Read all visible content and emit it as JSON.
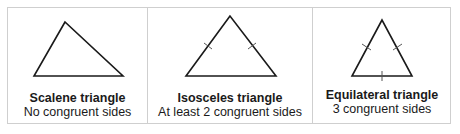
{
  "panels": [
    {
      "id": "scalene",
      "title": "Scalene triangle",
      "description": "No congruent sides",
      "congruent_marks": 0
    },
    {
      "id": "isosceles",
      "title": "Isosceles triangle",
      "description": "At least 2 congruent sides",
      "congruent_marks": 2
    },
    {
      "id": "equilateral",
      "title": "Equilateral triangle",
      "description": "3 congruent sides",
      "congruent_marks": 3
    }
  ],
  "colors": {
    "stroke": "#1a1a1a",
    "border": "#cfcfcf",
    "background": "#ffffff"
  }
}
